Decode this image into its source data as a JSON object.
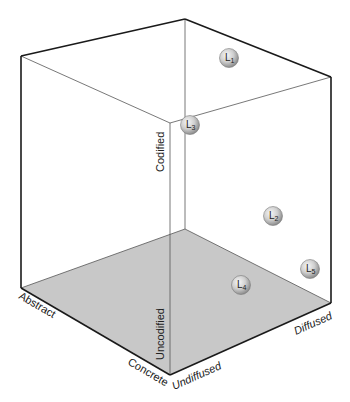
{
  "diagram": {
    "type": "3D cube (I-Space)",
    "top_clipped_text": "",
    "colors": {
      "edge": "#1a1a1a",
      "inner_edge": "#555555",
      "floor": "#c8c8c8",
      "ball_light": "#f2f2f2",
      "ball_dark": "#9a9a9a",
      "text": "#222222"
    },
    "axes": {
      "codification": {
        "high": "Codified",
        "low": "Uncodified"
      },
      "abstraction": {
        "high": "Abstract",
        "low": "Concrete"
      },
      "diffusion": {
        "low": "Undiffused",
        "high": "Diffused"
      }
    },
    "points": [
      {
        "id": "L1",
        "letter": "L",
        "sub": "1",
        "x": 229,
        "y": 58
      },
      {
        "id": "L2",
        "letter": "L",
        "sub": "2",
        "x": 273,
        "y": 216
      },
      {
        "id": "L3",
        "letter": "L",
        "sub": "3",
        "x": 190,
        "y": 125
      },
      {
        "id": "L4",
        "letter": "L",
        "sub": "4",
        "x": 241,
        "y": 285
      },
      {
        "id": "L5",
        "letter": "L",
        "sub": "5",
        "x": 310,
        "y": 269
      }
    ]
  }
}
